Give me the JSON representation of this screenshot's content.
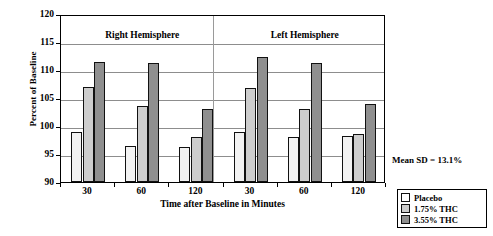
{
  "chart_data": {
    "type": "bar",
    "title": "",
    "xlabel": "Time after Baseline in Minutes",
    "ylabel": "Percent of Baseline",
    "ylim": [
      90,
      120
    ],
    "yticks": [
      90,
      95,
      100,
      105,
      110,
      115,
      120
    ],
    "grid": true,
    "legend_position": "bottom-right",
    "categories": [
      "30",
      "60",
      "120"
    ],
    "panels": [
      {
        "name": "Right Hemisphere",
        "series": [
          {
            "name": "Placebo",
            "values": [
              99.0,
              96.5,
              96.3
            ]
          },
          {
            "name": "1.75% THC",
            "values": [
              107.0,
              103.5,
              98.0
            ]
          },
          {
            "name": "3.55% THC",
            "values": [
              111.4,
              111.3,
              103.0
            ]
          }
        ]
      },
      {
        "name": "Left Hemisphere",
        "series": [
          {
            "name": "Placebo",
            "values": [
              99.0,
              98.0,
              98.2
            ]
          },
          {
            "name": "1.75% THC",
            "values": [
              106.8,
              103.0,
              98.6
            ]
          },
          {
            "name": "3.55% THC",
            "values": [
              112.3,
              111.2,
              104.0
            ]
          }
        ]
      }
    ],
    "annotation": "Mean  SD = 13.1%",
    "colors": {
      "placebo": "#f2f2f2",
      "thc175": "#cdcdcd",
      "thc355": "#8f8f8f",
      "axis": "#000000",
      "grid": "#8d8d8d"
    }
  },
  "legend": {
    "items": [
      {
        "label": "Placebo",
        "key": "placebo"
      },
      {
        "label": "1.75% THC",
        "key": "thc175"
      },
      {
        "label": "3.55% THC",
        "key": "thc355"
      }
    ]
  }
}
